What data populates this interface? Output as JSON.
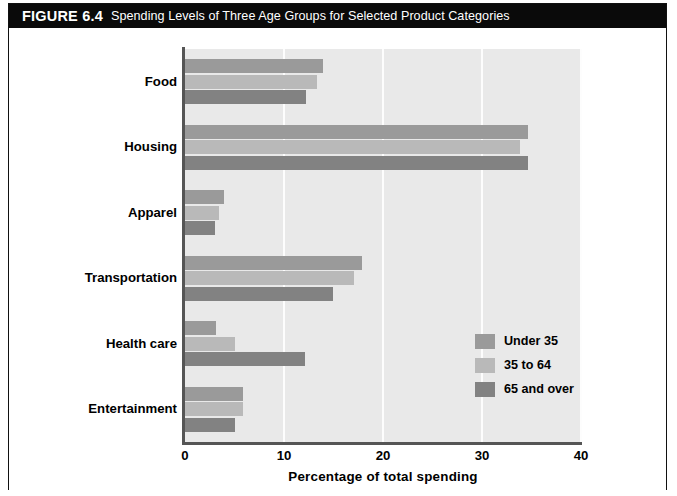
{
  "figure": {
    "number": "FIGURE 6.4",
    "caption": "Spending Levels of Three Age Groups for Selected Product Categories"
  },
  "chart_data": {
    "type": "bar",
    "orientation": "horizontal",
    "title": "Spending Levels of Three Age Groups for Selected Product Categories",
    "xlabel": "Percentage of total spending",
    "ylabel": "",
    "xlim": [
      0,
      40
    ],
    "xticks": [
      "0",
      "10",
      "20",
      "30",
      "40"
    ],
    "grid": "vertical",
    "legend_position": "lower-right",
    "categories": [
      "Food",
      "Housing",
      "Apparel",
      "Transportation",
      "Health care",
      "Entertainment"
    ],
    "series": [
      {
        "name": "Under 35",
        "color": "#9a9a9a",
        "values": [
          13.9,
          34.6,
          3.9,
          17.9,
          3.1,
          5.9
        ]
      },
      {
        "name": "35 to 64",
        "color": "#b9b9b9",
        "values": [
          13.3,
          33.8,
          3.4,
          17.1,
          5.0,
          5.9
        ]
      },
      {
        "name": "65 and over",
        "color": "#828282",
        "values": [
          12.2,
          34.6,
          3.0,
          14.9,
          12.1,
          5.0
        ]
      }
    ]
  }
}
